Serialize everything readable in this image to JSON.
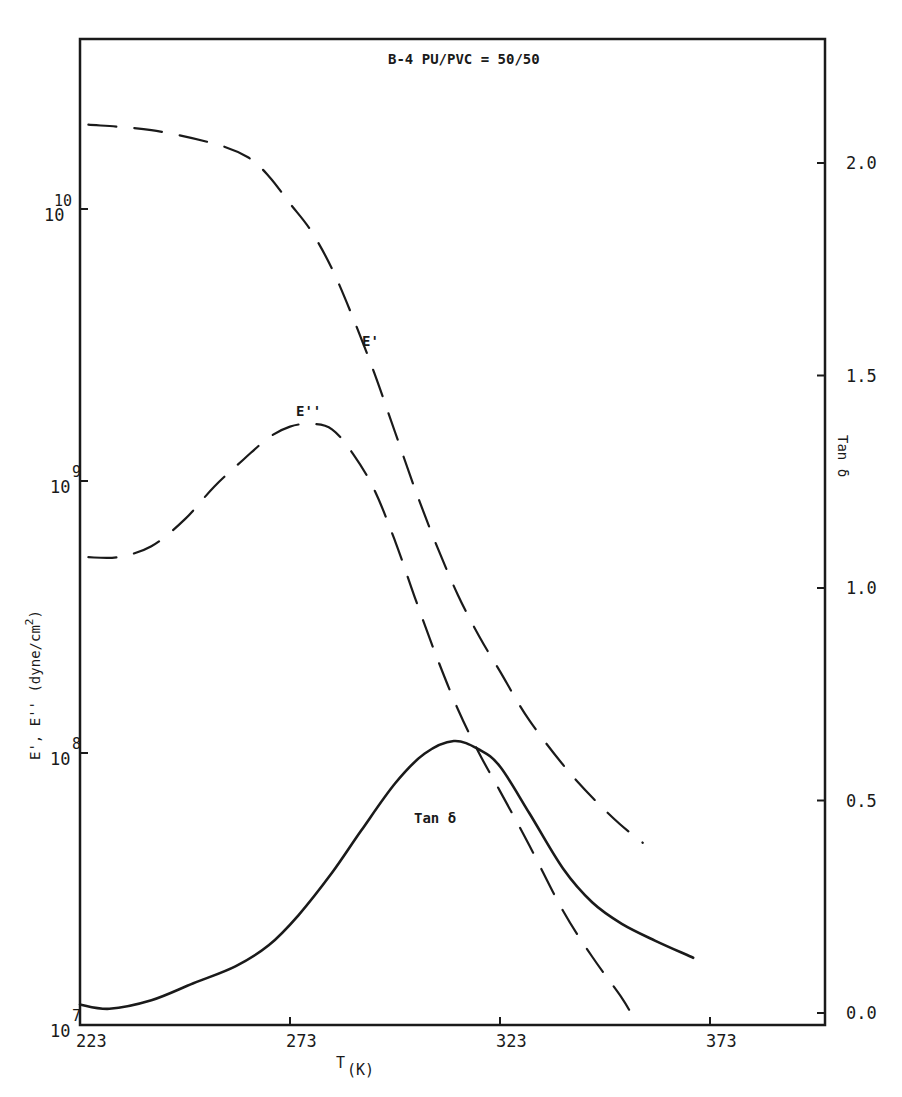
{
  "chart_data": {
    "type": "line",
    "title": "B-4 PU/PVC = 50/50",
    "xlabel": "T",
    "xlabel_sub": "(K)",
    "ylabel_left": "E', E'' (dyne/cm²)",
    "ylabel_left_parts": {
      "main": "E', E'' (dyne/cm",
      "sup": "2",
      "end": ")"
    },
    "ylabel_right": "Tan δ",
    "xlim": [
      223,
      398
    ],
    "ylim_left_log10": [
      7,
      10.6
    ],
    "ylim_right": [
      0.0,
      2.2
    ],
    "grid": false,
    "legend": "inline labels",
    "x_ticks": [
      {
        "value": 223,
        "label": "223"
      },
      {
        "value": 273,
        "label": "273"
      },
      {
        "value": 323,
        "label": "323"
      },
      {
        "value": 373,
        "label": "373"
      }
    ],
    "y_left_ticks": [
      {
        "log10": 7,
        "base": "10",
        "exp": "7"
      },
      {
        "log10": 8,
        "base": "10",
        "exp": "8"
      },
      {
        "log10": 9,
        "base": "10",
        "exp": "9"
      },
      {
        "log10": 10,
        "base": "10",
        "exp": "10"
      }
    ],
    "y_right_ticks": [
      {
        "value": 0.0,
        "label": "0.0"
      },
      {
        "value": 0.5,
        "label": "0.5"
      },
      {
        "value": 1.0,
        "label": "1.0"
      },
      {
        "value": 1.5,
        "label": "1.5"
      },
      {
        "value": 2.0,
        "label": "2.0"
      }
    ],
    "series": [
      {
        "name": "E'",
        "label": "E'",
        "axis": "left_log10",
        "style": "dashed",
        "x": [
          225,
          240,
          255,
          263,
          268,
          273,
          278,
          283,
          288,
          293,
          298,
          303,
          308,
          313,
          318,
          323,
          330,
          340,
          350,
          357
        ],
        "log10y": [
          10.31,
          10.29,
          10.24,
          10.19,
          10.12,
          10.02,
          9.92,
          9.78,
          9.6,
          9.4,
          9.18,
          8.96,
          8.76,
          8.58,
          8.43,
          8.3,
          8.12,
          7.92,
          7.76,
          7.67
        ]
      },
      {
        "name": "E''",
        "label": "E''",
        "axis": "left_log10",
        "style": "dashed",
        "x": [
          225,
          232,
          240,
          248,
          255,
          262,
          268,
          273,
          278,
          283,
          288,
          293,
          298,
          303,
          308,
          313,
          318,
          323,
          330,
          338,
          345,
          352,
          355
        ],
        "log10y": [
          8.72,
          8.72,
          8.76,
          8.86,
          8.98,
          9.08,
          9.16,
          9.2,
          9.21,
          9.19,
          9.1,
          8.97,
          8.78,
          8.56,
          8.35,
          8.16,
          8.0,
          7.86,
          7.66,
          7.42,
          7.25,
          7.1,
          7.02
        ]
      },
      {
        "name": "Tan δ",
        "label": "Tan δ",
        "axis": "right",
        "style": "solid",
        "x": [
          223,
          230,
          240,
          250,
          260,
          268,
          275,
          283,
          290,
          298,
          305,
          312,
          318,
          323,
          330,
          338,
          345,
          352,
          360,
          369
        ],
        "y": [
          0.02,
          0.01,
          0.03,
          0.07,
          0.11,
          0.16,
          0.23,
          0.33,
          0.43,
          0.54,
          0.61,
          0.64,
          0.62,
          0.58,
          0.47,
          0.34,
          0.26,
          0.21,
          0.17,
          0.13
        ]
      }
    ],
    "annotations": [
      {
        "text": "B-4 PU/PVC = 50/50",
        "role": "title"
      },
      {
        "text": "E'",
        "near_series": "E'"
      },
      {
        "text": "E''",
        "near_series": "E''"
      },
      {
        "text": "Tan δ",
        "near_series": "Tan δ"
      }
    ]
  },
  "colors": {
    "ink": "#1a1a1a",
    "background": "#ffffff"
  }
}
